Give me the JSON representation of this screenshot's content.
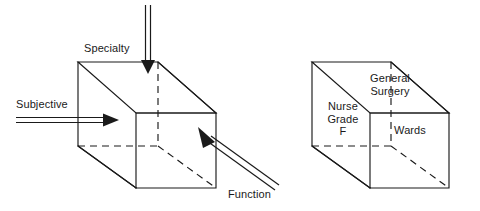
{
  "figure": {
    "stroke_color": "#1a1a1a",
    "background_color": "#ffffff"
  },
  "left_cube": {
    "name": "dimension-cube",
    "axis_labels": [
      {
        "id": "specialty",
        "text": "Specialty",
        "arrow": "vertical-down"
      },
      {
        "id": "subjective",
        "text": "Subjective",
        "arrow": "horizontal-right"
      },
      {
        "id": "function",
        "text": "Function",
        "arrow": "diagonal-up-left"
      }
    ]
  },
  "right_cube": {
    "name": "instance-cube",
    "face_labels": [
      {
        "id": "nurse-grade",
        "text": "Nurse\nGrade\nF"
      },
      {
        "id": "general-surgery",
        "text": "General\nSurgery"
      },
      {
        "id": "wards",
        "text": "Wards"
      }
    ]
  }
}
